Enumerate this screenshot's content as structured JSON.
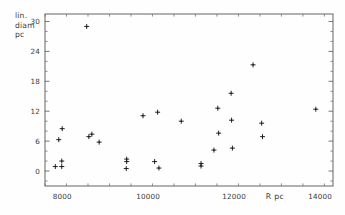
{
  "chart_data": {
    "type": "scatter",
    "title": "",
    "xlabel": "R pc",
    "ylabel": "lin. diam pc",
    "ylabel_lines": [
      "lin.",
      "diam",
      "pc"
    ],
    "xlim": [
      7600,
      14300
    ],
    "ylim": [
      -3,
      31.5
    ],
    "grid": false,
    "legend": null,
    "marker_style": "plus-cross",
    "xticks": [
      8000,
      10000,
      12000,
      14000
    ],
    "xtick_labels": [
      "8000",
      "10000",
      "12000",
      "14000"
    ],
    "xminor_step": 500,
    "yticks": [
      0,
      6,
      12,
      18,
      24,
      30
    ],
    "ytick_labels": [
      "0",
      "6",
      "12",
      "18",
      "24",
      "30"
    ],
    "yminor_step": 2,
    "series": [
      {
        "name": "globular clusters",
        "points": [
          {
            "x": 8570,
            "y": 29.0
          },
          {
            "x": 12440,
            "y": 21.3
          },
          {
            "x": 11930,
            "y": 15.6
          },
          {
            "x": 11620,
            "y": 12.6
          },
          {
            "x": 10220,
            "y": 11.8
          },
          {
            "x": 13900,
            "y": 12.4
          },
          {
            "x": 9880,
            "y": 11.1
          },
          {
            "x": 10770,
            "y": 10.0
          },
          {
            "x": 11940,
            "y": 10.2
          },
          {
            "x": 12640,
            "y": 9.6
          },
          {
            "x": 8000,
            "y": 8.5
          },
          {
            "x": 11640,
            "y": 7.6
          },
          {
            "x": 8690,
            "y": 7.4
          },
          {
            "x": 8620,
            "y": 6.9
          },
          {
            "x": 12660,
            "y": 6.9
          },
          {
            "x": 7920,
            "y": 6.3
          },
          {
            "x": 8860,
            "y": 5.8
          },
          {
            "x": 11960,
            "y": 4.6
          },
          {
            "x": 11530,
            "y": 4.2
          },
          {
            "x": 9500,
            "y": 2.4
          },
          {
            "x": 9500,
            "y": 1.9
          },
          {
            "x": 7990,
            "y": 2.0
          },
          {
            "x": 10150,
            "y": 1.9
          },
          {
            "x": 11230,
            "y": 1.5
          },
          {
            "x": 11230,
            "y": 1.0
          },
          {
            "x": 7840,
            "y": 0.9
          },
          {
            "x": 7990,
            "y": 0.9
          },
          {
            "x": 9490,
            "y": 0.5
          },
          {
            "x": 10250,
            "y": 0.6
          }
        ]
      }
    ]
  }
}
